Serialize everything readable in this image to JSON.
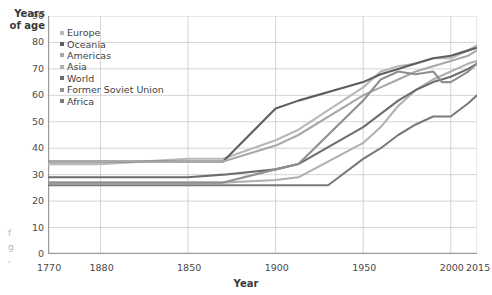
{
  "axis_titles": {
    "y": "Years\nof age",
    "x": "Year"
  },
  "edge_fragments": [
    {
      "text": "f",
      "x": 8,
      "y": 232
    },
    {
      "text": "g",
      "x": 8,
      "y": 246
    },
    {
      "text": ",",
      "x": 8,
      "y": 258
    }
  ],
  "legend": {
    "position": "top-left",
    "items": [
      {
        "label": "Europe",
        "color": "#b8b8b8"
      },
      {
        "label": "Oceania",
        "color": "#5e5e5e"
      },
      {
        "label": "Americas",
        "color": "#a8a8a8"
      },
      {
        "label": "Asia",
        "color": "#b0b0b0"
      },
      {
        "label": "World",
        "color": "#6d6d6d"
      },
      {
        "label": "Former Soviet Union",
        "color": "#8f8f8f"
      },
      {
        "label": "Africa",
        "color": "#7a7a7a"
      }
    ]
  },
  "chart_data": {
    "type": "line",
    "title": "",
    "subtitle": "",
    "xlabel": "Year",
    "ylabel": "Years of age",
    "xlim": [
      1770,
      2015
    ],
    "ylim": [
      0,
      90
    ],
    "grid": true,
    "legend_position": "top-left",
    "yticks": [
      0,
      10,
      20,
      30,
      40,
      50,
      60,
      70,
      80,
      90
    ],
    "ytick_labels": [
      "0",
      "10",
      "20",
      "30",
      "40",
      "50",
      "60",
      "70",
      "80",
      "90"
    ],
    "xticks": [
      1770,
      1800,
      1850,
      1900,
      1950,
      2000,
      2015
    ],
    "xtick_labels": [
      "1770",
      "1880",
      "1850",
      "1900",
      "1950",
      "2000",
      "2015"
    ],
    "series": [
      {
        "name": "Europe",
        "color": "#b8b8b8",
        "x": [
          1770,
          1800,
          1850,
          1870,
          1900,
          1913,
          1950,
          1960,
          1970,
          1980,
          1990,
          2000,
          2010,
          2015
        ],
        "values": [
          34,
          34,
          36,
          36,
          43,
          47,
          63,
          69,
          71,
          72,
          74,
          74,
          77,
          79
        ]
      },
      {
        "name": "Oceania",
        "color": "#5e5e5e",
        "x": [
          1770,
          1800,
          1850,
          1870,
          1900,
          1913,
          1950,
          1960,
          1970,
          1980,
          1990,
          2000,
          2010,
          2015
        ],
        "values": [
          35,
          35,
          35,
          35,
          55,
          58,
          65,
          68,
          70,
          72,
          74,
          75,
          77,
          78
        ]
      },
      {
        "name": "Americas",
        "color": "#a8a8a8",
        "x": [
          1770,
          1800,
          1850,
          1870,
          1900,
          1913,
          1950,
          1960,
          1970,
          1980,
          1990,
          2000,
          2010,
          2015
        ],
        "values": [
          35,
          35,
          35,
          35,
          41,
          45,
          60,
          63,
          66,
          69,
          71,
          73,
          75,
          77
        ]
      },
      {
        "name": "Asia",
        "color": "#b0b0b0",
        "x": [
          1770,
          1800,
          1850,
          1870,
          1900,
          1913,
          1950,
          1960,
          1970,
          1980,
          1990,
          2000,
          2010,
          2015
        ],
        "values": [
          27,
          27,
          27,
          27,
          28,
          29,
          42,
          48,
          56,
          62,
          66,
          69,
          72,
          73
        ]
      },
      {
        "name": "World",
        "color": "#6d6d6d",
        "x": [
          1770,
          1800,
          1850,
          1870,
          1900,
          1913,
          1950,
          1960,
          1970,
          1980,
          1990,
          2000,
          2010,
          2015
        ],
        "values": [
          29,
          29,
          29,
          30,
          32,
          34,
          48,
          53,
          58,
          62,
          65,
          67,
          70,
          72
        ]
      },
      {
        "name": "Former Soviet Union",
        "color": "#8f8f8f",
        "x": [
          1770,
          1800,
          1850,
          1870,
          1900,
          1913,
          1950,
          1960,
          1970,
          1980,
          1990,
          1995,
          2000,
          2010,
          2015
        ],
        "values": [
          27,
          27,
          27,
          27,
          32,
          34,
          58,
          66,
          69,
          68,
          69,
          65,
          65,
          69,
          72
        ]
      },
      {
        "name": "Africa",
        "color": "#7a7a7a",
        "x": [
          1770,
          1800,
          1850,
          1870,
          1900,
          1913,
          1930,
          1950,
          1960,
          1970,
          1980,
          1990,
          2000,
          2010,
          2015
        ],
        "values": [
          26,
          26,
          26,
          26,
          26,
          26,
          26,
          36,
          40,
          45,
          49,
          52,
          52,
          57,
          60
        ]
      }
    ]
  }
}
